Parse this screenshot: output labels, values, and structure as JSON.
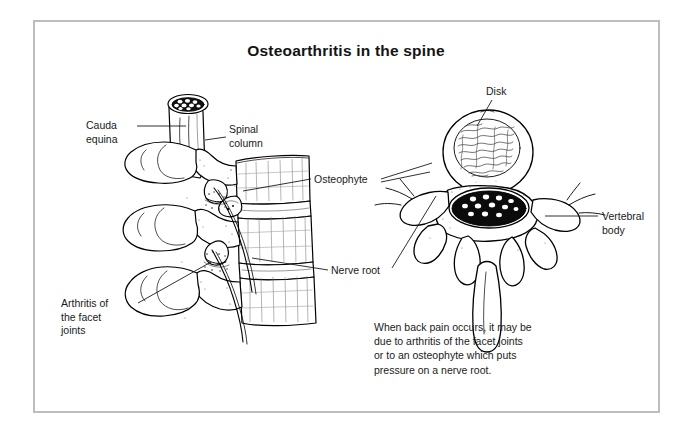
{
  "figure": {
    "title": "Osteoarthritis in the spine",
    "frame_color": "#bdbdbd",
    "background_color": "#ffffff",
    "ink_color": "#000000",
    "type": "medical-anatomical-illustration",
    "views": {
      "left": "lateral view of lumbar spine segment",
      "right": "axial (cross-sectional) view of a vertebra and disk"
    }
  },
  "labels": {
    "cauda_equina": "Cauda\nequina",
    "spinal_column": "Spinal\ncolumn",
    "osteophyte": "Osteophyte",
    "nerve_root": "Nerve root",
    "arthritis_facet": "Arthritis of\nthe facet\njoints",
    "disk": "Disk",
    "vertebral_body": "Vertebral\nbody"
  },
  "caption": {
    "text": "When back pain occurs, it may be due to arthritis of the facet joints or to an osteophyte which puts pressure on a nerve root."
  },
  "anatomy": {
    "cauda_equina_nerve_count": 9,
    "spinal_canal_nerve_count": 12,
    "vertebrae_shown": 3,
    "disks_shown": 2
  }
}
